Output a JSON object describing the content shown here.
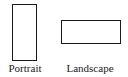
{
  "diagram": {
    "items": [
      {
        "label": "Portrait",
        "orientation": "portrait"
      },
      {
        "label": "Landscape",
        "orientation": "landscape"
      }
    ],
    "colors": {
      "stroke": "#1a1a1a",
      "background": "#ffffff",
      "text": "#222222"
    }
  }
}
